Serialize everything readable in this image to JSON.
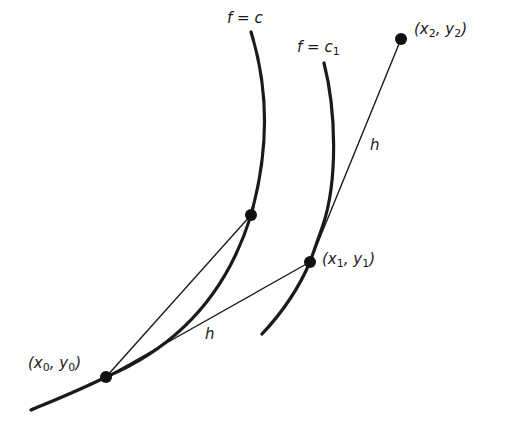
{
  "diagram": {
    "curves": [
      {
        "id": "level-curve-c",
        "label": "f = c"
      },
      {
        "id": "level-curve-c1",
        "label_main": "f = c",
        "label_sub": "1"
      }
    ],
    "points": {
      "p0": {
        "open": "(x",
        "xsub": "0",
        "mid": ", y",
        "ysub": "0",
        "close": ")"
      },
      "p1": {
        "open": "(x",
        "xsub": "1",
        "mid": ", y",
        "ysub": "1",
        "close": ")"
      },
      "p2": {
        "open": "(x",
        "xsub": "2",
        "mid": ", y",
        "ysub": "2",
        "close": ")"
      }
    },
    "segment_labels": {
      "h_lower": "h",
      "h_upper": "h"
    },
    "colors": {
      "ink": "#1a1a1a",
      "background": "#ffffff"
    }
  }
}
